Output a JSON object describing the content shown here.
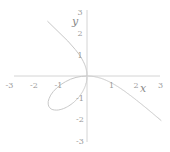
{
  "chart_data": {
    "type": "line",
    "title": "",
    "xlabel": "x",
    "ylabel": "y",
    "xlim": [
      -3,
      3
    ],
    "ylim": [
      -3,
      3
    ],
    "grid": false,
    "xticks": [
      "-3",
      "-2",
      "-1",
      "1",
      "2",
      "3"
    ],
    "yticks": [
      "3",
      "2",
      "1",
      "-1",
      "-2",
      "-3"
    ],
    "series": [
      {
        "name": "folium",
        "equation": "x^3 + y^3 = -3xy",
        "parameter_a": -1,
        "asymptote": "x + y = 1",
        "color": "#c8c8c8",
        "points": [
          [
            -2.0,
            3.0
          ],
          [
            -1.0,
            1.77
          ],
          [
            -0.5,
            0.85
          ],
          [
            0,
            0
          ],
          [
            0.5,
            -0.36
          ],
          [
            1.0,
            -1.0
          ],
          [
            2.0,
            -1.6
          ],
          [
            2.6,
            -2.0
          ],
          [
            -1.5,
            -1.5
          ],
          [
            -0.75,
            -1.35
          ],
          [
            -1.35,
            -0.75
          ]
        ]
      }
    ]
  },
  "colors": {
    "axis": "#d0d0d0",
    "curve": "#c8c8c8",
    "tick_text": "#9a9a9a"
  }
}
